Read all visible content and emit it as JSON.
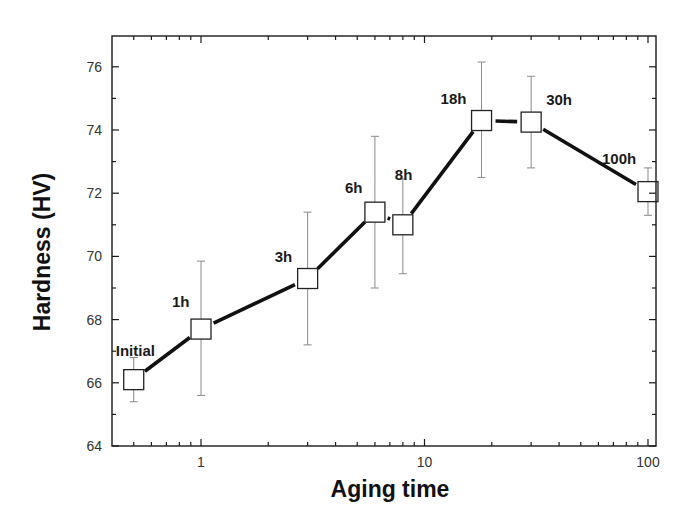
{
  "chart_data": {
    "type": "line",
    "title": "",
    "xlabel": "Aging time",
    "ylabel": "Hardness (HV)",
    "xscale": "log",
    "xlim": [
      0.4,
      103
    ],
    "ylim": [
      64,
      77
    ],
    "xticks": [
      1,
      10,
      100
    ],
    "xtick_labels": [
      "1",
      "10",
      "100"
    ],
    "yticks": [
      64,
      66,
      68,
      70,
      72,
      74,
      76
    ],
    "ytick_labels": [
      "64",
      "66",
      "68",
      "70",
      "72",
      "74",
      "76"
    ],
    "grid": false,
    "legend": null,
    "marker": "open-square",
    "series": [
      {
        "name": "Hardness",
        "points": [
          {
            "label": "Initial",
            "x": 0.5,
            "y": 66.1,
            "err_low": 65.4,
            "err_high": 66.8
          },
          {
            "label": "1h",
            "x": 1,
            "y": 67.7,
            "err_low": 65.6,
            "err_high": 69.85
          },
          {
            "label": "3h",
            "x": 3,
            "y": 69.3,
            "err_low": 67.2,
            "err_high": 71.4
          },
          {
            "label": "6h",
            "x": 6,
            "y": 71.4,
            "err_low": 69.0,
            "err_high": 73.8
          },
          {
            "label": "8h",
            "x": 8,
            "y": 71.0,
            "err_low": 69.45,
            "err_high": 72.45
          },
          {
            "label": "18h",
            "x": 18,
            "y": 74.3,
            "err_low": 72.5,
            "err_high": 76.15
          },
          {
            "label": "30h",
            "x": 30,
            "y": 74.25,
            "err_low": 72.8,
            "err_high": 75.7
          },
          {
            "label": "100h",
            "x": 100,
            "y": 72.05,
            "err_low": 71.3,
            "err_high": 72.8
          }
        ]
      }
    ],
    "annotations": [
      "Initial",
      "1h",
      "3h",
      "6h",
      "8h",
      "18h",
      "30h",
      "100h"
    ]
  },
  "layout": {
    "frame": {
      "left": 112,
      "top": 36,
      "right": 656,
      "bottom": 446
    },
    "x_decade_px": 223.5,
    "x_at_1": 201,
    "y_px_per_unit": 31.6,
    "label_offsets": {
      "Initial": [
        -18,
        -24
      ],
      "1h": [
        -29,
        -22
      ],
      "3h": [
        -33,
        -17
      ],
      "6h": [
        -30,
        -19
      ],
      "8h": [
        -8,
        -45
      ],
      "18h": [
        -41,
        -17
      ],
      "30h": [
        15,
        -17
      ],
      "100h": [
        -46,
        -28
      ]
    }
  }
}
